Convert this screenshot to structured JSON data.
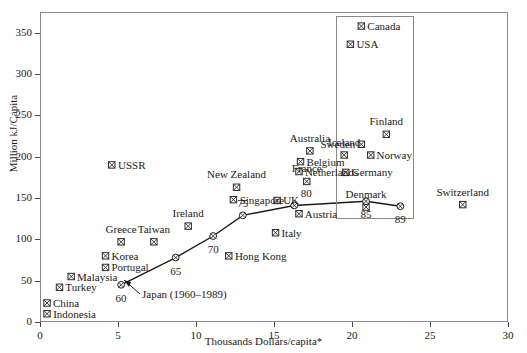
{
  "chart_data": {
    "type": "scatter",
    "title": "",
    "xlabel": "Thousands Dollars/capita*",
    "ylabel": "Million kJ/Capita",
    "xlim": [
      0,
      30
    ],
    "ylim": [
      0,
      375
    ],
    "xticks": [
      0,
      5,
      10,
      15,
      20,
      25,
      30
    ],
    "yticks": [
      0,
      50,
      100,
      150,
      200,
      250,
      300,
      350
    ],
    "grid": false,
    "legend": "none",
    "marker_glyph": "square-with-x",
    "points": [
      {
        "name": "Indonesia",
        "x": 0.45,
        "y": 10,
        "label_dx": 10,
        "label_dy": 0
      },
      {
        "name": "China",
        "x": 0.45,
        "y": 23,
        "label_dx": 10,
        "label_dy": 0
      },
      {
        "name": "Turkey",
        "x": 1.25,
        "y": 42,
        "label_dx": 10,
        "label_dy": 0
      },
      {
        "name": "Malaysia",
        "x": 2.0,
        "y": 55,
        "label_dx": 10,
        "label_dy": 0
      },
      {
        "name": "Korea",
        "x": 4.2,
        "y": 80,
        "label_dx": 10,
        "label_dy": 0
      },
      {
        "name": "Portugal",
        "x": 4.2,
        "y": 66,
        "label_dx": 10,
        "label_dy": 0
      },
      {
        "name": "Greece",
        "x": 5.2,
        "y": 97,
        "label_dx": 0,
        "label_dy": -13
      },
      {
        "name": "Taiwan",
        "x": 7.3,
        "y": 97,
        "label_dx": 0,
        "label_dy": -13
      },
      {
        "name": "Ireland",
        "x": 9.5,
        "y": 116,
        "label_dx": 0,
        "label_dy": -13
      },
      {
        "name": "Hong Kong",
        "x": 12.1,
        "y": 80,
        "label_dx": 10,
        "label_dy": 0
      },
      {
        "name": "Singapore",
        "x": 12.4,
        "y": 148,
        "label_dx": 10,
        "label_dy": 0
      },
      {
        "name": "New Zealand",
        "x": 12.6,
        "y": 163,
        "label_dx": 0,
        "label_dy": -13
      },
      {
        "name": "Italy",
        "x": 15.1,
        "y": 108,
        "label_dx": 10,
        "label_dy": 0
      },
      {
        "name": "UK",
        "x": 15.2,
        "y": 147,
        "label_dx": 10,
        "label_dy": 0
      },
      {
        "name": "Austria",
        "x": 16.6,
        "y": 131,
        "label_dx": 10,
        "label_dy": 0
      },
      {
        "name": "France",
        "x": 17.1,
        "y": 170,
        "label_dx": 0,
        "label_dy": -13
      },
      {
        "name": "Netherlands",
        "x": 16.6,
        "y": 182,
        "label_dx": 10,
        "label_dy": 0
      },
      {
        "name": "Belgium",
        "x": 16.7,
        "y": 194,
        "label_dx": 10,
        "label_dy": 0
      },
      {
        "name": "Australia",
        "x": 17.3,
        "y": 207,
        "label_dx": 0,
        "label_dy": -13
      },
      {
        "name": "USSR",
        "x": 4.6,
        "y": 190,
        "label_dx": 10,
        "label_dy": 0
      },
      {
        "name": "Germany",
        "x": 19.6,
        "y": 181,
        "label_dx": 10,
        "label_dy": 0
      },
      {
        "name": "Iceland",
        "x": 19.5,
        "y": 202,
        "label_dx": 0,
        "label_dy": -13
      },
      {
        "name": "Sweden",
        "x": 20.6,
        "y": 215,
        "label_dx": -10,
        "label_dy": 0
      },
      {
        "name": "Norway",
        "x": 21.2,
        "y": 202,
        "label_dx": 10,
        "label_dy": 0
      },
      {
        "name": "Finland",
        "x": 22.2,
        "y": 227,
        "label_dx": 0,
        "label_dy": -13
      },
      {
        "name": "USA",
        "x": 19.9,
        "y": 336,
        "label_dx": 10,
        "label_dy": 0
      },
      {
        "name": "Canada",
        "x": 20.6,
        "y": 358,
        "label_dx": 10,
        "label_dy": 0
      },
      {
        "name": "Denmark",
        "x": 20.9,
        "y": 139,
        "label_dx": 0,
        "label_dy": -13
      },
      {
        "name": "Switzerland",
        "x": 27.1,
        "y": 142,
        "label_dx": 0,
        "label_dy": -13
      }
    ],
    "series": [
      {
        "name": "Japan (1960-1989)",
        "annotation": "Japan (1960–1989)",
        "type": "line",
        "x": [
          5.2,
          8.7,
          11.1,
          13.0,
          16.3,
          20.9,
          23.1
        ],
        "y": [
          45,
          78,
          104,
          129,
          141,
          146,
          140
        ],
        "year_labels": [
          "60",
          "65",
          "70",
          "75",
          "80",
          "85",
          "89"
        ]
      }
    ],
    "inset_box": {
      "x0": 19.0,
      "x1": 24.0,
      "y0": 124,
      "y1": 370
    }
  },
  "axes": {
    "y_title": "Million kJ/Capita",
    "x_title": "Thousands Dollars/capita*"
  }
}
